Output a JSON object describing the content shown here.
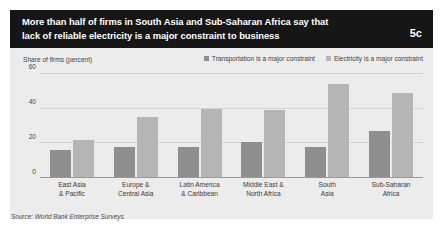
{
  "header": {
    "title_line1": "More than half of firms in South Asia and Sub-Saharan Africa say that",
    "title_line2": "lack of reliable electricity is a major constraint to business",
    "figure_number": "5c"
  },
  "source_note": "Source: World Bank Enterprise Surveys.",
  "colors": {
    "header_background": "#161616",
    "panel_background": "#ececed",
    "transportation_bar": "#8e8e8e",
    "electricity_bar": "#b5b5b5",
    "gridline": "#d2d2d3",
    "text": "#444444"
  },
  "chart_data": {
    "type": "bar",
    "title": "More than half of firms in South Asia and Sub-Saharan Africa say that lack of reliable electricity is a major constraint to business",
    "xlabel": "",
    "ylabel": "Share of firms (percent)",
    "ylim": [
      0,
      60
    ],
    "yticks": [
      0,
      20,
      40,
      60
    ],
    "ytick_labels": [
      "0",
      "20",
      "40",
      "60"
    ],
    "grid": true,
    "legend_position": "top-right",
    "categories": [
      "East Asia & Pacific",
      "Europe & Central Asia",
      "Latin America & Caribbean",
      "Middle East & North Africa",
      "South Asia",
      "Sub-Saharan Africa"
    ],
    "category_lines": [
      [
        "East Asia",
        "& Pacific"
      ],
      [
        "Europe &",
        "Central Asia"
      ],
      [
        "Latin America",
        "& Caribbean"
      ],
      [
        "Middle East &",
        "North Africa"
      ],
      [
        "South",
        "Asia"
      ],
      [
        "Sub-Saharan",
        "Africa"
      ]
    ],
    "series": [
      {
        "name": "Transportation is a major constraint",
        "color": "#8e8e8e",
        "values": [
          16,
          18,
          18,
          21,
          18,
          27
        ]
      },
      {
        "name": "Electricity is a major constraint",
        "color": "#b5b5b5",
        "values": [
          22,
          35,
          40,
          39,
          54,
          49
        ]
      }
    ]
  }
}
